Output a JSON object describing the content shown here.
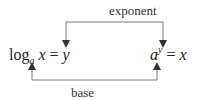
{
  "labels": {
    "top": "exponent",
    "bottom": "base"
  },
  "left_equation": {
    "fn": "log",
    "base": "a",
    "arg": "x",
    "eq": "=",
    "result": "y"
  },
  "right_equation": {
    "base": "a",
    "exponent": "y",
    "eq": "=",
    "result": "x"
  },
  "colors": {
    "line": "#7a7a7a",
    "text": "#222222"
  }
}
